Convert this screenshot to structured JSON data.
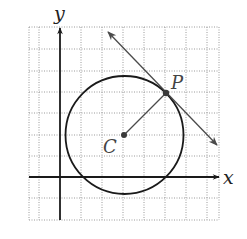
{
  "diagram": {
    "type": "coordinate-geometry",
    "axes": {
      "x_label": "x",
      "y_label": "y"
    },
    "grid": {
      "x_range": [
        -1.5,
        7.5
      ],
      "y_range": [
        -2,
        7
      ],
      "spacing": 1,
      "style": "dotted"
    },
    "points": {
      "center": {
        "label": "C",
        "x": 3,
        "y": 2
      },
      "tangent_point": {
        "label": "P",
        "x": 5,
        "y": 4
      }
    },
    "circle": {
      "center_label": "C",
      "radius_description": "distance CP"
    },
    "tangent_line": {
      "through": "P",
      "direction": "perpendicular to CP",
      "arrows": "both ends"
    },
    "segment": {
      "from": "C",
      "to": "P"
    },
    "colors": {
      "axis": "#1a1a1a",
      "grid": "#9a9a9a",
      "circle": "#1a1a1a",
      "tangent": "#4a4a4a",
      "point": "#3a3a3a"
    }
  }
}
